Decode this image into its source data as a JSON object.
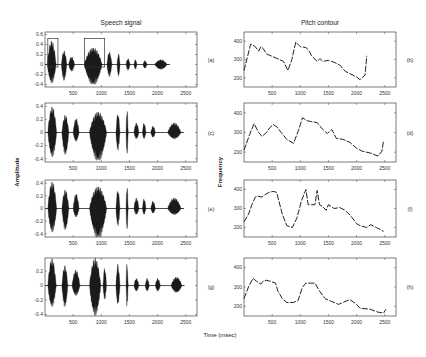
{
  "figure": {
    "left_column_title": "Speech signal",
    "right_column_title": "Pitch contour",
    "shared_xlabel": "Time (msec)",
    "left_ylabel": "Amplitude",
    "right_ylabel": "Frequency"
  },
  "chart_data": [
    {
      "type": "area",
      "panel": "(a)",
      "title": "Speech signal",
      "xlabel": "Time (msec)",
      "ylabel": "Amplitude",
      "xlim": [
        0,
        2700
      ],
      "ylim": [
        -0.45,
        0.65
      ],
      "xticks": [
        500,
        1000,
        1500,
        2000,
        2500
      ],
      "yticks": [
        -0.4,
        -0.2,
        0,
        0.2,
        0.4,
        0.6
      ],
      "annotations": [
        "rectangle 50-230ms",
        "rectangle 700-1060ms"
      ],
      "segments": [
        {
          "start": 40,
          "end": 220,
          "peak_pos": 0.48,
          "peak_neg": -0.38
        },
        {
          "start": 290,
          "end": 400,
          "peak_pos": 0.28,
          "peak_neg": -0.33
        },
        {
          "start": 420,
          "end": 540,
          "peak_pos": 0.16,
          "peak_neg": -0.14
        },
        {
          "start": 700,
          "end": 1060,
          "peak_pos": 0.34,
          "peak_neg": -0.42
        },
        {
          "start": 1100,
          "end": 1200,
          "peak_pos": 0.26,
          "peak_neg": -0.25
        },
        {
          "start": 1280,
          "end": 1340,
          "peak_pos": 0.22,
          "peak_neg": -0.25
        },
        {
          "start": 1440,
          "end": 1520,
          "peak_pos": 0.12,
          "peak_neg": -0.12
        },
        {
          "start": 1580,
          "end": 1640,
          "peak_pos": 0.1,
          "peak_neg": -0.1
        },
        {
          "start": 1740,
          "end": 1820,
          "peak_pos": 0.08,
          "peak_neg": -0.08
        },
        {
          "start": 1950,
          "end": 2200,
          "peak_pos": 0.1,
          "peak_neg": -0.1
        }
      ]
    },
    {
      "type": "line",
      "panel": "(b)",
      "title": "Pitch contour",
      "xlabel": "Time (msec)",
      "ylabel": "Frequency",
      "xlim": [
        0,
        2700
      ],
      "ylim": [
        150,
        450
      ],
      "xticks": [
        500,
        1000,
        1500,
        2000,
        2500
      ],
      "yticks": [
        200,
        300,
        400
      ],
      "x": [
        0,
        120,
        200,
        260,
        300,
        340,
        400,
        480,
        700,
        780,
        850,
        920,
        1000,
        1100,
        1150,
        1200,
        1300,
        1350,
        1400,
        1500,
        1600,
        1700,
        1800,
        1900,
        2000,
        2060,
        2150,
        2180
      ],
      "y": [
        240,
        385,
        370,
        345,
        370,
        360,
        330,
        320,
        290,
        240,
        300,
        395,
        370,
        365,
        350,
        320,
        290,
        305,
        290,
        295,
        285,
        270,
        235,
        220,
        205,
        190,
        215,
        320
      ]
    },
    {
      "type": "area",
      "panel": "(c)",
      "xlabel": "Time (msec)",
      "ylabel": "Amplitude",
      "xlim": [
        0,
        2700
      ],
      "ylim": [
        -0.45,
        0.45
      ],
      "xticks": [
        500,
        1000,
        1500,
        2000,
        2500
      ],
      "yticks": [
        -0.4,
        -0.2,
        0,
        0.2,
        0.4
      ],
      "segments": [
        {
          "start": 50,
          "end": 230,
          "peak_pos": 0.4,
          "peak_neg": -0.38
        },
        {
          "start": 300,
          "end": 440,
          "peak_pos": 0.27,
          "peak_neg": -0.35
        },
        {
          "start": 500,
          "end": 620,
          "peak_pos": 0.22,
          "peak_neg": -0.14
        },
        {
          "start": 790,
          "end": 1140,
          "peak_pos": 0.32,
          "peak_neg": -0.45
        },
        {
          "start": 1260,
          "end": 1340,
          "peak_pos": 0.3,
          "peak_neg": -0.28
        },
        {
          "start": 1440,
          "end": 1480,
          "peak_pos": 0.38,
          "peak_neg": -0.36
        },
        {
          "start": 1580,
          "end": 1680,
          "peak_pos": 0.15,
          "peak_neg": -0.1
        },
        {
          "start": 1730,
          "end": 1800,
          "peak_pos": 0.15,
          "peak_neg": -0.1
        },
        {
          "start": 1880,
          "end": 1970,
          "peak_pos": 0.1,
          "peak_neg": -0.08
        },
        {
          "start": 2180,
          "end": 2450,
          "peak_pos": 0.15,
          "peak_neg": -0.1
        }
      ]
    },
    {
      "type": "line",
      "panel": "(d)",
      "xlabel": "Time (msec)",
      "ylabel": "Frequency",
      "xlim": [
        0,
        2700
      ],
      "ylim": [
        150,
        450
      ],
      "xticks": [
        500,
        1000,
        1500,
        2000,
        2500
      ],
      "yticks": [
        200,
        300,
        400
      ],
      "x": [
        0,
        100,
        180,
        260,
        320,
        400,
        460,
        520,
        580,
        660,
        760,
        880,
        960,
        1040,
        1120,
        1200,
        1300,
        1400,
        1480,
        1560,
        1640,
        1760,
        1880,
        2000,
        2100,
        2250,
        2380,
        2450,
        2480
      ],
      "y": [
        210,
        290,
        345,
        300,
        280,
        300,
        325,
        340,
        330,
        300,
        265,
        245,
        305,
        375,
        360,
        355,
        350,
        315,
        295,
        315,
        270,
        265,
        250,
        220,
        205,
        195,
        180,
        205,
        260
      ]
    },
    {
      "type": "area",
      "panel": "(e)",
      "xlabel": "Time (msec)",
      "ylabel": "Amplitude",
      "xlim": [
        0,
        2700
      ],
      "ylim": [
        -0.45,
        0.45
      ],
      "xticks": [
        500,
        1000,
        1500,
        2000,
        2500
      ],
      "yticks": [
        -0.4,
        -0.2,
        0,
        0.2,
        0.4
      ],
      "segments": [
        {
          "start": 50,
          "end": 230,
          "peak_pos": 0.43,
          "peak_neg": -0.38
        },
        {
          "start": 300,
          "end": 440,
          "peak_pos": 0.3,
          "peak_neg": -0.35
        },
        {
          "start": 500,
          "end": 620,
          "peak_pos": 0.24,
          "peak_neg": -0.14
        },
        {
          "start": 790,
          "end": 1140,
          "peak_pos": 0.35,
          "peak_neg": -0.48
        },
        {
          "start": 1260,
          "end": 1340,
          "peak_pos": 0.3,
          "peak_neg": -0.28
        },
        {
          "start": 1440,
          "end": 1480,
          "peak_pos": 0.38,
          "peak_neg": -0.36
        },
        {
          "start": 1580,
          "end": 1680,
          "peak_pos": 0.17,
          "peak_neg": -0.1
        },
        {
          "start": 1730,
          "end": 1800,
          "peak_pos": 0.16,
          "peak_neg": -0.1
        },
        {
          "start": 1880,
          "end": 1970,
          "peak_pos": 0.12,
          "peak_neg": -0.08
        },
        {
          "start": 2180,
          "end": 2450,
          "peak_pos": 0.17,
          "peak_neg": -0.1
        }
      ]
    },
    {
      "type": "line",
      "panel": "(f)",
      "xlabel": "Time (msec)",
      "ylabel": "Frequency",
      "xlim": [
        0,
        2700
      ],
      "ylim": [
        150,
        450
      ],
      "xticks": [
        500,
        1000,
        1500,
        2000,
        2500
      ],
      "yticks": [
        200,
        300,
        400
      ],
      "x": [
        0,
        80,
        140,
        200,
        240,
        320,
        360,
        440,
        520,
        580,
        680,
        760,
        860,
        940,
        1020,
        1100,
        1140,
        1200,
        1260,
        1300,
        1340,
        1400,
        1460,
        1500,
        1600,
        1700,
        1800,
        1900,
        2000,
        2060,
        2180,
        2250,
        2350,
        2480
      ],
      "y": [
        230,
        270,
        320,
        360,
        365,
        360,
        370,
        385,
        390,
        385,
        270,
        210,
        200,
        250,
        340,
        400,
        320,
        320,
        320,
        395,
        320,
        310,
        290,
        320,
        300,
        305,
        290,
        260,
        220,
        210,
        200,
        215,
        200,
        180
      ]
    },
    {
      "type": "area",
      "panel": "(g)",
      "xlabel": "Time (msec)",
      "ylabel": "Amplitude",
      "xlim": [
        0,
        2700
      ],
      "ylim": [
        -0.42,
        0.38
      ],
      "xticks": [
        500,
        1000,
        1500,
        2000,
        2500
      ],
      "yticks": [
        -0.4,
        -0.2,
        0,
        0.2
      ],
      "segments": [
        {
          "start": 50,
          "end": 220,
          "peak_pos": 0.38,
          "peak_neg": -0.3
        },
        {
          "start": 300,
          "end": 420,
          "peak_pos": 0.28,
          "peak_neg": -0.3
        },
        {
          "start": 480,
          "end": 640,
          "peak_pos": 0.22,
          "peak_neg": -0.14
        },
        {
          "start": 790,
          "end": 1020,
          "peak_pos": 0.38,
          "peak_neg": -0.42
        },
        {
          "start": 1030,
          "end": 1100,
          "peak_pos": 0.25,
          "peak_neg": -0.2
        },
        {
          "start": 1260,
          "end": 1340,
          "peak_pos": 0.3,
          "peak_neg": -0.28
        },
        {
          "start": 1440,
          "end": 1480,
          "peak_pos": 0.32,
          "peak_neg": -0.3
        },
        {
          "start": 1580,
          "end": 1680,
          "peak_pos": 0.1,
          "peak_neg": -0.08
        },
        {
          "start": 1780,
          "end": 1860,
          "peak_pos": 0.1,
          "peak_neg": -0.08
        },
        {
          "start": 1960,
          "end": 2060,
          "peak_pos": 0.1,
          "peak_neg": -0.08
        },
        {
          "start": 2240,
          "end": 2460,
          "peak_pos": 0.12,
          "peak_neg": -0.1
        }
      ]
    },
    {
      "type": "line",
      "panel": "(h)",
      "xlabel": "Time (msec)",
      "ylabel": "Frequency",
      "xlim": [
        0,
        2700
      ],
      "ylim": [
        150,
        450
      ],
      "xticks": [
        500,
        1000,
        1500,
        2000,
        2500
      ],
      "yticks": [
        200,
        300,
        400
      ],
      "x": [
        0,
        80,
        160,
        220,
        300,
        340,
        400,
        460,
        560,
        600,
        680,
        760,
        880,
        960,
        1040,
        1100,
        1150,
        1200,
        1260,
        1340,
        1440,
        1560,
        1680,
        1760,
        1880,
        2000,
        2060,
        2240,
        2380,
        2480,
        2520
      ],
      "y": [
        240,
        300,
        345,
        330,
        315,
        330,
        335,
        330,
        320,
        280,
        240,
        220,
        220,
        230,
        300,
        320,
        320,
        320,
        320,
        280,
        240,
        225,
        210,
        220,
        235,
        210,
        190,
        185,
        170,
        165,
        185
      ]
    }
  ]
}
